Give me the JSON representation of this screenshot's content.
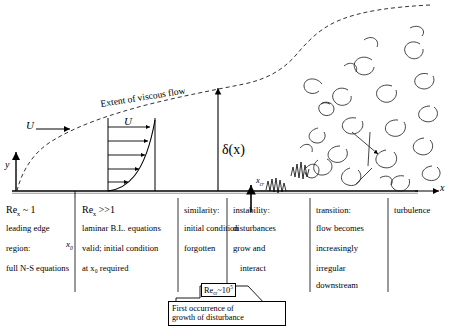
{
  "diagram": {
    "title_annotation": "Extent of viscous flow",
    "axes": {
      "x_label": "x",
      "y_label": "y"
    },
    "freestream_label_left": "U",
    "profile_label": "U",
    "thickness_label": "δ(x)",
    "critical_x_label": "x",
    "critical_x_sub": "cr",
    "station_label": "x",
    "station_sub": "0"
  },
  "columns": [
    {
      "id": "leading-edge",
      "heading_main": "Re",
      "heading_sub": "x",
      "heading_rest": "~ 1",
      "lines": [
        "leading edge",
        "region:",
        "full N-S equations"
      ]
    },
    {
      "id": "laminar",
      "heading_main": "Re",
      "heading_sub": "x",
      "heading_rest": ">>1",
      "lines": [
        "laminar B.L. equations",
        "valid; initial condition",
        "at x₀ required"
      ]
    },
    {
      "id": "similarity",
      "heading_main": "similarity:",
      "lines": [
        "initial condition",
        "forgotten"
      ]
    },
    {
      "id": "instability",
      "heading_main": "instability:",
      "lines": [
        "disturbances",
        "grow and",
        "interact"
      ]
    },
    {
      "id": "transition",
      "heading_main": "transition:",
      "lines": [
        "flow becomes",
        "increasingly",
        "irregular",
        "downstream"
      ]
    },
    {
      "id": "turbulence",
      "heading_main": "turbulence",
      "lines": []
    }
  ],
  "callout": {
    "re_tag_main": "Re",
    "re_tag_sub": "cr",
    "re_tag_rest": "~10",
    "re_tag_exp": "5",
    "line1": "First occurrence of",
    "line2": "growth of disturbance"
  },
  "colors": {
    "ink": "#000000",
    "background": "#ffffff"
  }
}
